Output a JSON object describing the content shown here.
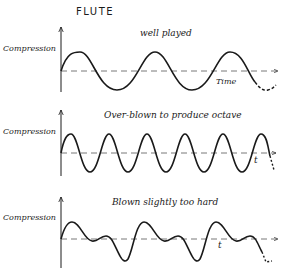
{
  "title": "FLUTE",
  "panels": [
    {
      "caption": "well played",
      "ylabel": "Compression",
      "xlabel": "Time",
      "waveform": "pure sine, fundamental"
    },
    {
      "caption": "Over-blown to produce octave",
      "ylabel": "Compression",
      "xlabel": "t",
      "waveform": "pure sine, double frequency"
    },
    {
      "caption": "Blown slightly too hard",
      "ylabel": "Compression",
      "xlabel": "t",
      "waveform": "fundamental plus harmonics"
    }
  ]
}
